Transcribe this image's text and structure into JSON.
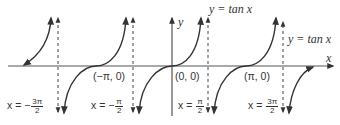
{
  "figure": {
    "function_label_top": "y = tan x",
    "function_label_right": "y = tan x",
    "axes": {
      "x_label": "x",
      "y_label": "y"
    },
    "points": [
      {
        "label": "(−π, 0)",
        "x": "-pi",
        "y": 0
      },
      {
        "label": "(0, 0)",
        "x": 0,
        "y": 0
      },
      {
        "label": "(π, 0)",
        "x": "pi",
        "y": 0
      }
    ],
    "asymptotes": [
      {
        "prefix": "x = −",
        "num": "3π",
        "den": "2"
      },
      {
        "prefix": "x = −",
        "num": "π",
        "den": "2"
      },
      {
        "prefix": "x = ",
        "num": "π",
        "den": "2"
      },
      {
        "prefix": "x = ",
        "num": "3π",
        "den": "2"
      }
    ],
    "colors": {
      "curve": "#333333",
      "axis": "#444444",
      "asymptote": "#444444"
    }
  }
}
